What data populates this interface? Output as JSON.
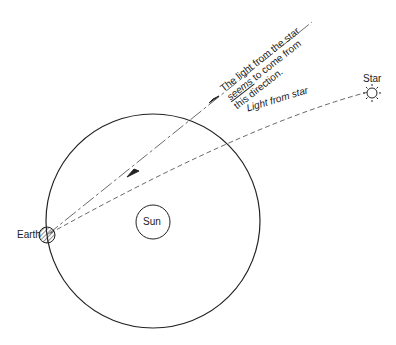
{
  "diagram": {
    "labels": {
      "earth": "Earth",
      "sun": "Sun",
      "star": "Star",
      "light_from_star": "Light from star",
      "apparent_line1": "The light from the star",
      "apparent_line2_em": "seems",
      "apparent_line2_rest": " to come from",
      "apparent_line3": "this direction."
    },
    "colors": {
      "stroke": "#222222",
      "background": "#ffffff"
    }
  }
}
